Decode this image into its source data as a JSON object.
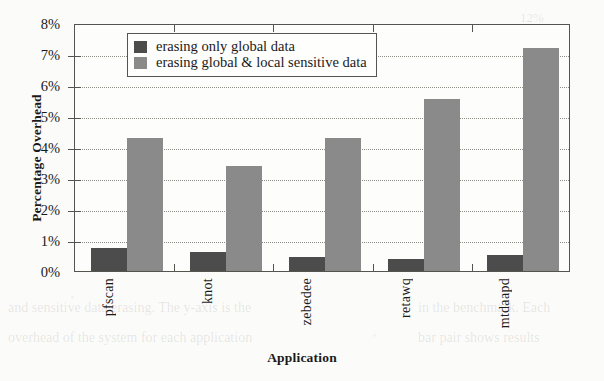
{
  "chart_data": {
    "type": "bar",
    "title": "",
    "xlabel": "Application",
    "ylabel": "Percentage Overhead",
    "categories": [
      "pfscan",
      "knot",
      "zebedee",
      "retawq",
      "mtdaapd"
    ],
    "series": [
      {
        "name": "erasing only global data",
        "color": "#4c4c4c",
        "values": [
          0.75,
          0.62,
          0.44,
          0.38,
          0.52
        ]
      },
      {
        "name": "erasing global & local sensitive data",
        "color": "#8a8a8a",
        "values": [
          4.3,
          3.4,
          4.3,
          5.55,
          7.2
        ]
      }
    ],
    "ylim": [
      0,
      8
    ],
    "ytick_labels": [
      "0%",
      "1%",
      "2%",
      "3%",
      "4%",
      "5%",
      "6%",
      "7%",
      "8%"
    ],
    "ytick_values": [
      0,
      1,
      2,
      3,
      4,
      5,
      6,
      7,
      8
    ],
    "grid": "horizontal-dotted",
    "legend_position": "top-left-inside"
  },
  "legend": {
    "entries": [
      {
        "label": "erasing only global data",
        "swatch": "dark"
      },
      {
        "label": "erasing global & local sensitive data",
        "swatch": "light"
      }
    ]
  },
  "background_text": {
    "right_margin": "12%",
    "lower_left_line_1": "and sensitive data erasing. The y-axis is the",
    "lower_left_line_2": "overhead of the system for each application",
    "lower_right_line_1": "in the benchmark. Each",
    "lower_right_line_2": "bar pair shows results"
  }
}
